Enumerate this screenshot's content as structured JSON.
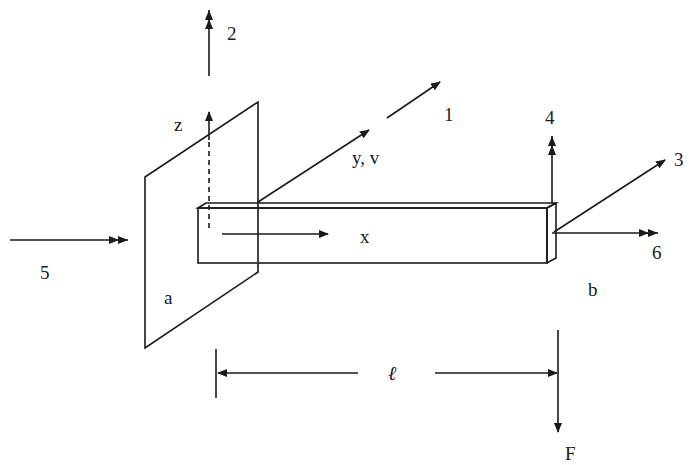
{
  "figure": {
    "labels": {
      "dof_1": "1",
      "dof_2": "2",
      "dof_3": "3",
      "dof_4": "4",
      "dof_5": "5",
      "dof_6": "6",
      "axis_x": "x",
      "axis_y": "y, v",
      "axis_z": "z",
      "end_a": "a",
      "end_b": "b",
      "length": "ℓ",
      "force": "F"
    },
    "arrow_types": {
      "translation": "single-arrowhead",
      "rotation": "double-arrowhead"
    },
    "colors": {
      "ink": "#1a1a1a",
      "background": "#ffffff"
    }
  }
}
